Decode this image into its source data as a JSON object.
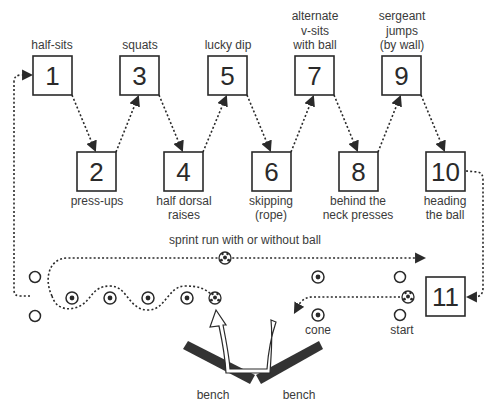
{
  "diagram": {
    "stations": [
      {
        "number": "1",
        "label_lines": [
          "half-sits"
        ]
      },
      {
        "number": "2",
        "label_lines": [
          "press-ups"
        ]
      },
      {
        "number": "3",
        "label_lines": [
          "squats"
        ]
      },
      {
        "number": "4",
        "label_lines": [
          "half dorsal",
          "raises"
        ]
      },
      {
        "number": "5",
        "label_lines": [
          "lucky dip"
        ]
      },
      {
        "number": "6",
        "label_lines": [
          "skipping",
          "(rope)"
        ]
      },
      {
        "number": "7",
        "label_lines": [
          "alternate",
          "v-sits",
          "with ball"
        ]
      },
      {
        "number": "8",
        "label_lines": [
          "behind the",
          "neck presses"
        ]
      },
      {
        "number": "9",
        "label_lines": [
          "sergeant",
          "jumps",
          "(by wall)"
        ]
      },
      {
        "number": "10",
        "label_lines": [
          "heading",
          "the ball"
        ]
      },
      {
        "number": "11",
        "label_lines": []
      }
    ],
    "sprint_label": "sprint run with or without ball",
    "field_labels": {
      "cone": "cone",
      "start": "start",
      "bench_left": "bench",
      "bench_right": "bench"
    },
    "icons": {
      "ball": "soccer-ball-icon",
      "cone": "cone-icon",
      "marker": "open-circle-marker-icon",
      "bench": "bench-icon"
    },
    "colors": {
      "ink": "#2a2a2a",
      "bench": "#333333",
      "background": "#ffffff"
    }
  }
}
